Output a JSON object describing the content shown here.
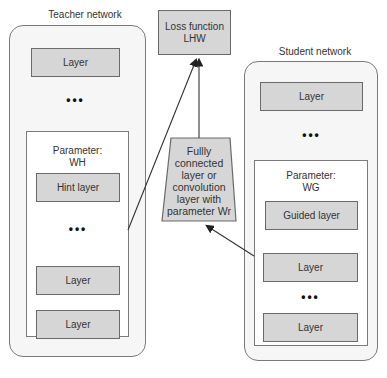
{
  "teacher": {
    "title": "Teacher network",
    "top_layer": "Layer",
    "dots": "•••",
    "param_label": "Parameter:",
    "param_name": "WH",
    "hint_layer": "Hint layer",
    "inner_dots": "•••",
    "layer_a": "Layer",
    "layer_b": "Layer"
  },
  "loss": {
    "line1": "Loss function",
    "line2": "LHW"
  },
  "regressor": {
    "lines": [
      "Fullly",
      "connected",
      "layer or",
      "convolution",
      "layer with",
      "parameter Wr"
    ]
  },
  "student": {
    "title": "Student network",
    "top_layer": "Layer",
    "dots": "•••",
    "param_label": "Parameter:",
    "param_name": "WG",
    "guided_layer": "Guided layer",
    "layer_a": "Layer",
    "inner_dots": "•••",
    "layer_b": "Layer"
  },
  "colors": {
    "box_fill": "#d6d6d6",
    "outline": "#6a6a6a",
    "network_fill": "#f6f6f6"
  }
}
